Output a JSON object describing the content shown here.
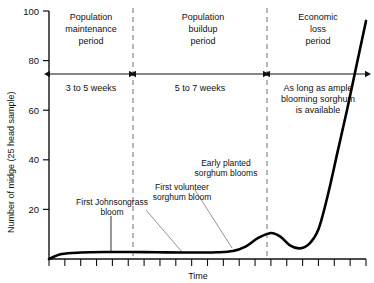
{
  "chart_data": {
    "type": "line",
    "title": "",
    "xlabel": "Time",
    "ylabel": "Number of midge (25 head sample)",
    "ylim": [
      0,
      100
    ],
    "yticks": [
      0,
      20,
      40,
      60,
      80,
      100
    ],
    "ytick_labels": [
      "",
      "20",
      "40",
      "60",
      "80",
      "100"
    ],
    "xticks_count": 21,
    "xtick_labels": [],
    "grid": false,
    "legend": null,
    "series": [
      {
        "name": "Midge population",
        "x": [
          0,
          4,
          10,
          18,
          26,
          34,
          42,
          48,
          53,
          58,
          62,
          66,
          70,
          73,
          76,
          79,
          82,
          85,
          88,
          91,
          94,
          97,
          100
        ],
        "y": [
          0,
          2.0,
          2.6,
          2.8,
          2.8,
          2.7,
          2.6,
          2.6,
          2.7,
          3.2,
          5.0,
          8.5,
          10.5,
          9.0,
          5.5,
          4.3,
          6.0,
          12.0,
          26.0,
          43.0,
          60.0,
          78.0,
          96.0
        ]
      }
    ],
    "periods": [
      {
        "name": "Population maintenance period",
        "duration_label": "3 to 5 weeks",
        "x_start": 0,
        "x_end": 31
      },
      {
        "name": "Population buildup period",
        "duration_label": "5 to 7 weeks",
        "x_start": 31,
        "x_end": 72
      },
      {
        "name": "Economic loss period",
        "duration_label": "As long as ample blooming sorghum is available",
        "x_start": 72,
        "x_end": 100
      }
    ],
    "dividers_x": [
      31,
      72
    ],
    "annotations": [
      {
        "text": "First Johnsongrass bloom",
        "target_x": 24,
        "target_y": 3
      },
      {
        "text": "First volunteer sorghum bloom",
        "target_x": 33,
        "target_y": 3
      },
      {
        "text": "Early planted sorghum blooms",
        "target_x": 47,
        "target_y": 3
      }
    ]
  },
  "axis": {
    "y_title": "Number of midge (25 head sample)",
    "x_title": "Time",
    "y_tick_100": "100",
    "y_tick_80": "80",
    "y_tick_60": "60",
    "y_tick_40": "40",
    "y_tick_20": "20"
  },
  "periods": {
    "p1_line1": "Population",
    "p1_line2": "maintenance",
    "p1_line3": "period",
    "p2_line1": "Population",
    "p2_line2": "buildup",
    "p2_line3": "period",
    "p3_line1": "Economic",
    "p3_line2": "loss",
    "p3_line3": "period"
  },
  "spans": {
    "span1": "3 to 5 weeks",
    "span2": "5 to 7 weeks",
    "span3_line1": "As long as ample",
    "span3_line2": "blooming sorghum",
    "span3_line3": "is available"
  },
  "annotations": {
    "a1_line1": "First Johnsongrass",
    "a1_line2": "bloom",
    "a2_line1": "First volunteer",
    "a2_line2": "sorghum bloom",
    "a3_line1": "Early planted",
    "a3_line2": "sorghum blooms"
  },
  "colors": {
    "ink": "#111111",
    "curve": "#000000",
    "divider": "#8a8a8a",
    "leader": "#777777",
    "background": "#ffffff"
  }
}
